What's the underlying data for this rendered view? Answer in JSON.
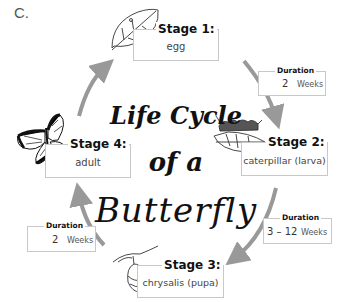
{
  "label": "C.",
  "title": {
    "line1": "Life Cycle",
    "line2": "of a",
    "line3": "Butterfly"
  },
  "stages": [
    {
      "heading": "Stage 1:",
      "name": "egg",
      "icon": "leaf-icon"
    },
    {
      "heading": "Stage 2:",
      "name": "caterpillar (larva)",
      "icon": "caterpillar-icon"
    },
    {
      "heading": "Stage 3:",
      "name": "chrysalis (pupa)",
      "icon": "chrysalis-icon"
    },
    {
      "heading": "Stage 4:",
      "name": "adult",
      "icon": "butterfly-icon"
    }
  ],
  "durations": [
    {
      "heading": "Duration",
      "value": "2",
      "unit": "Weeks"
    },
    {
      "heading": "Duration",
      "value": "3 – 12",
      "unit": "Weeks"
    },
    {
      "heading": "Duration",
      "value": "2",
      "unit": "Weeks"
    }
  ],
  "colors": {
    "arrow": "#999999",
    "box_border": "#c8c8c8"
  }
}
